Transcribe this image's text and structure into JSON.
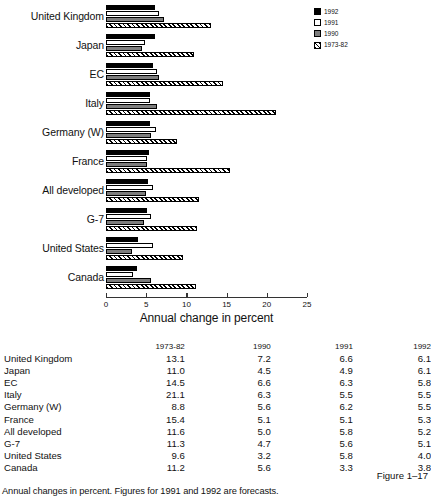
{
  "chart_data": {
    "type": "bar",
    "orientation": "horizontal",
    "title": "",
    "xlabel": "Annual change in percent",
    "ylabel": "",
    "xlim": [
      0,
      25
    ],
    "xticks": [
      0,
      5,
      10,
      15,
      20,
      25
    ],
    "grid": false,
    "legend_position": "top-right",
    "categories": [
      "United Kingdom",
      "Japan",
      "EC",
      "Italy",
      "Germany (W)",
      "France",
      "All developed",
      "G-7",
      "United States",
      "Canada"
    ],
    "series": [
      {
        "name": "1992",
        "values": [
          6.1,
          6.1,
          5.8,
          5.5,
          5.5,
          5.3,
          5.2,
          5.1,
          4.0,
          3.8
        ]
      },
      {
        "name": "1991",
        "values": [
          6.6,
          4.9,
          6.3,
          5.5,
          6.2,
          5.1,
          5.8,
          5.6,
          5.8,
          3.3
        ]
      },
      {
        "name": "1990",
        "values": [
          7.2,
          4.5,
          6.6,
          6.3,
          5.6,
          5.1,
          5.0,
          4.7,
          3.2,
          5.6
        ]
      },
      {
        "name": "1973-82",
        "values": [
          13.1,
          11.0,
          14.5,
          21.1,
          8.8,
          15.4,
          11.6,
          11.3,
          9.6,
          11.2
        ]
      }
    ]
  },
  "legend": {
    "items": [
      {
        "label": "1992",
        "key": "y1992",
        "color": "#000000"
      },
      {
        "label": "1991",
        "key": "y1991",
        "color": "#ffffff"
      },
      {
        "label": "1990",
        "key": "y1990",
        "color": "#7d7d7d"
      },
      {
        "label": "1973-82",
        "key": "y1973",
        "color": "#ffffff"
      }
    ]
  },
  "axis": {
    "title": "Annual change in percent",
    "ticks": [
      "0",
      "5",
      "10",
      "15",
      "20",
      "25"
    ]
  },
  "table": {
    "corner_header": "",
    "headers": [
      "1973-82",
      "1990",
      "1991",
      "1992"
    ],
    "rows": [
      {
        "name": "United Kingdom",
        "values": [
          "13.1",
          "7.2",
          "6.6",
          "6.1"
        ]
      },
      {
        "name": "Japan",
        "values": [
          "11.0",
          "4.5",
          "4.9",
          "6.1"
        ]
      },
      {
        "name": "EC",
        "values": [
          "14.5",
          "6.6",
          "6.3",
          "5.8"
        ]
      },
      {
        "name": "Italy",
        "values": [
          "21.1",
          "6.3",
          "5.5",
          "5.5"
        ]
      },
      {
        "name": "Germany (W)",
        "values": [
          "8.8",
          "5.6",
          "6.2",
          "5.5"
        ]
      },
      {
        "name": "France",
        "values": [
          "15.4",
          "5.1",
          "5.1",
          "5.3"
        ]
      },
      {
        "name": "All developed",
        "values": [
          "11.6",
          "5.0",
          "5.8",
          "5.2"
        ]
      },
      {
        "name": "G-7",
        "values": [
          "11.3",
          "4.7",
          "5.6",
          "5.1"
        ]
      },
      {
        "name": "United States",
        "values": [
          "9.6",
          "3.2",
          "5.8",
          "4.0"
        ]
      },
      {
        "name": "Canada",
        "values": [
          "11.2",
          "5.6",
          "3.3",
          "3.8"
        ]
      }
    ]
  },
  "figure_number": "Figure 1–17",
  "footnote": "Annual changes in percent. Figures for 1991 and 1992 are forecasts."
}
